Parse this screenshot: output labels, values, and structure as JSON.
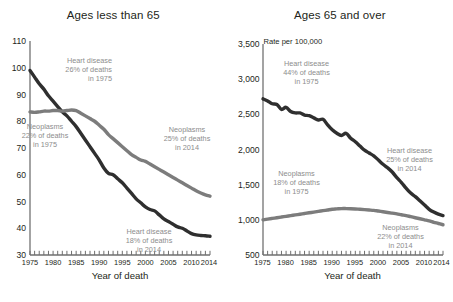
{
  "figure": {
    "panels": [
      {
        "title": "Ages less than 65",
        "y_axis_note": "",
        "x_axis_title": "Year of death",
        "y_ticks": [
          "110",
          "100",
          "90",
          "80",
          "70",
          "60",
          "50",
          "40",
          "30"
        ],
        "x_ticks": [
          "1975",
          "1980",
          "1985",
          "1990",
          "1995",
          "2000",
          "2005",
          "2010",
          "2014"
        ],
        "annotations": [
          {
            "name": "heart-disease-1975",
            "lines": [
              "Heart disease",
              "26% of deaths",
              "in 1975"
            ]
          },
          {
            "name": "neoplasms-1975",
            "lines": [
              "Neoplasms",
              "22% of deaths",
              "in 1975"
            ]
          },
          {
            "name": "neoplasms-2014",
            "lines": [
              "Neoplasms",
              "25% of deaths",
              "in 2014"
            ]
          },
          {
            "name": "heart-disease-2014",
            "lines": [
              "Heart disease",
              "18% of deaths",
              "in 2014"
            ]
          }
        ]
      },
      {
        "title": "Ages 65 and over",
        "y_axis_note": "Rate per 100,000",
        "x_axis_title": "Year of death",
        "y_ticks": [
          "3,500",
          "3,000",
          "2,500",
          "2,000",
          "1,500",
          "1,000",
          "500"
        ],
        "x_ticks": [
          "1975",
          "1980",
          "1985",
          "1990",
          "1995",
          "2000",
          "2005",
          "2010",
          "2014"
        ],
        "annotations": [
          {
            "name": "heart-disease-1975",
            "lines": [
              "Heart disease",
              "44% of deaths",
              "in 1975"
            ]
          },
          {
            "name": "neoplasms-1975",
            "lines": [
              "Neoplasms",
              "18% of deaths",
              "in 1975"
            ]
          },
          {
            "name": "heart-disease-2014",
            "lines": [
              "Heart disease",
              "25% of deaths",
              "in 2014"
            ]
          },
          {
            "name": "neoplasms-2014",
            "lines": [
              "Neoplasms",
              "22% of deaths",
              "in 2014"
            ]
          }
        ]
      }
    ],
    "colors": {
      "heart_disease_line": "#2f2f2f",
      "neoplasms_line": "#7c7c7c",
      "axis": "#8c8c8c",
      "text": "#231f20",
      "annotation_text": "#8d8d8d"
    }
  },
  "chart_data": [
    {
      "type": "line",
      "title": "Ages less than 65",
      "xlabel": "Year of death",
      "ylabel": "",
      "xlim": [
        1975,
        2014
      ],
      "ylim": [
        30,
        110
      ],
      "grid": false,
      "legend": "annotations on plot",
      "x": [
        1975,
        1976,
        1977,
        1978,
        1979,
        1980,
        1981,
        1982,
        1983,
        1984,
        1985,
        1986,
        1987,
        1988,
        1989,
        1990,
        1991,
        1992,
        1993,
        1994,
        1995,
        1996,
        1997,
        1998,
        1999,
        2000,
        2001,
        2002,
        2003,
        2004,
        2005,
        2006,
        2007,
        2008,
        2009,
        2010,
        2011,
        2012,
        2013,
        2014
      ],
      "series": [
        {
          "name": "Heart disease",
          "color": "#2f2f2f",
          "values": [
            99.0,
            96.5,
            94.0,
            92.0,
            89.5,
            87.5,
            85.5,
            83.5,
            82.0,
            80.0,
            78.0,
            75.5,
            73.0,
            70.5,
            68.0,
            65.5,
            62.5,
            60.5,
            60.0,
            58.5,
            57.0,
            55.0,
            53.0,
            51.0,
            49.5,
            48.0,
            47.0,
            46.5,
            45.0,
            43.5,
            42.5,
            41.5,
            40.5,
            40.0,
            39.0,
            38.0,
            37.5,
            37.3,
            37.2,
            37.0
          ]
        },
        {
          "name": "Neoplasms",
          "color": "#7c7c7c",
          "values": [
            83.5,
            83.3,
            83.5,
            83.8,
            83.8,
            84.0,
            84.0,
            83.8,
            84.0,
            84.2,
            84.0,
            83.0,
            82.0,
            81.0,
            80.0,
            78.5,
            77.0,
            75.0,
            73.5,
            72.0,
            70.5,
            69.0,
            67.5,
            66.5,
            65.5,
            65.0,
            64.0,
            63.0,
            62.0,
            61.0,
            60.0,
            59.0,
            58.0,
            57.0,
            56.0,
            55.0,
            54.0,
            53.2,
            52.5,
            52.0
          ]
        }
      ]
    },
    {
      "type": "line",
      "title": "Ages 65 and over",
      "xlabel": "Year of death",
      "ylabel": "Rate per 100,000",
      "xlim": [
        1975,
        2014
      ],
      "ylim": [
        500,
        3500
      ],
      "grid": false,
      "legend": "annotations on plot",
      "x": [
        1975,
        1976,
        1977,
        1978,
        1979,
        1980,
        1981,
        1982,
        1983,
        1984,
        1985,
        1986,
        1987,
        1988,
        1989,
        1990,
        1991,
        1992,
        1993,
        1994,
        1995,
        1996,
        1997,
        1998,
        1999,
        2000,
        2001,
        2002,
        2003,
        2004,
        2005,
        2006,
        2007,
        2008,
        2009,
        2010,
        2011,
        2012,
        2013,
        2014
      ],
      "series": [
        {
          "name": "Heart disease",
          "color": "#2f2f2f",
          "values": [
            2720,
            2690,
            2650,
            2640,
            2570,
            2600,
            2540,
            2520,
            2520,
            2490,
            2480,
            2450,
            2420,
            2430,
            2350,
            2280,
            2230,
            2200,
            2230,
            2160,
            2110,
            2050,
            1990,
            1950,
            1910,
            1850,
            1790,
            1740,
            1680,
            1600,
            1530,
            1450,
            1380,
            1330,
            1270,
            1210,
            1150,
            1110,
            1080,
            1060
          ]
        },
        {
          "name": "Neoplasms",
          "color": "#7c7c7c",
          "values": [
            1000,
            1010,
            1020,
            1030,
            1040,
            1050,
            1060,
            1070,
            1080,
            1090,
            1100,
            1110,
            1120,
            1130,
            1140,
            1150,
            1155,
            1160,
            1160,
            1158,
            1155,
            1150,
            1145,
            1140,
            1135,
            1125,
            1115,
            1105,
            1095,
            1085,
            1072,
            1060,
            1045,
            1030,
            1015,
            1000,
            985,
            965,
            948,
            930
          ]
        }
      ]
    }
  ]
}
